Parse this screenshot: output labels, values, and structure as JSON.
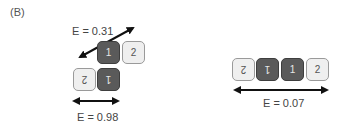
{
  "panel_label": "(B)",
  "left_config": {
    "energy_diagonal": "E = 0.31",
    "energy_horizontal": "E = 0.98",
    "top_row": [
      {
        "label": "1",
        "type": "dark"
      },
      {
        "label": "2",
        "type": "light"
      }
    ],
    "bottom_row": [
      {
        "label": "2",
        "type": "light",
        "rotated": true
      },
      {
        "label": "1",
        "type": "dark",
        "rotated": true
      }
    ]
  },
  "right_config": {
    "energy_horizontal": "E = 0.07",
    "row": [
      {
        "label": "2",
        "type": "light",
        "rotated": true
      },
      {
        "label": "1",
        "type": "dark",
        "rotated": true
      },
      {
        "label": "1",
        "type": "dark"
      },
      {
        "label": "2",
        "type": "light"
      }
    ]
  },
  "colors": {
    "dark_box": "#5a5a5a",
    "light_box": "#efefef",
    "arrow": "#111111"
  }
}
